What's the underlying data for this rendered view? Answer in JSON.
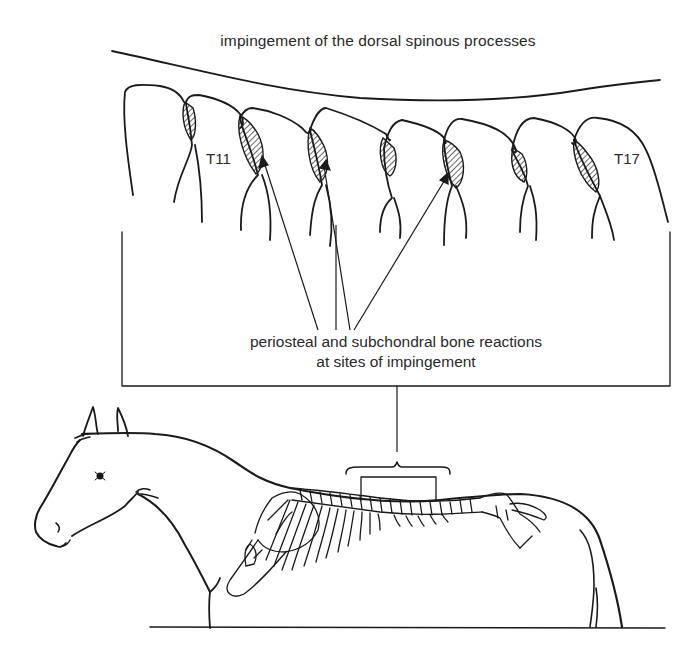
{
  "diagram": {
    "title": "impingement of the dorsal spinous processes",
    "vertebra_labels": {
      "first": "T11",
      "last": "T17"
    },
    "annotation": {
      "line1": "periosteal and subchondral bone reactions",
      "line2": "at sites of impingement"
    },
    "colors": {
      "ink": "#1a1a1a",
      "text": "#2a2a2a",
      "background": "#ffffff"
    },
    "elements": {
      "spinous_process_count": 8,
      "impingement_sites_hatched": 7,
      "arrows_to_sites": 4,
      "subject": "horse-with-skeleton-overlay"
    }
  }
}
